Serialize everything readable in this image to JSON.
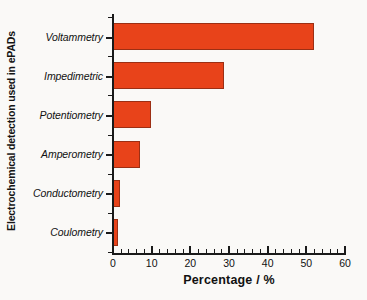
{
  "chart_data": {
    "type": "bar",
    "orientation": "horizontal",
    "title": "",
    "xlabel": "Percentage / %",
    "ylabel": "Electrochemical detection used in ePADs",
    "categories": [
      "Voltammetry",
      "Impedimetric",
      "Potentiometry",
      "Amperometry",
      "Conductometry",
      "Coulometry"
    ],
    "values": [
      52.0,
      28.7,
      9.8,
      6.9,
      1.7,
      1.2
    ],
    "xlim": [
      0,
      60
    ],
    "xticks": [
      0,
      10,
      20,
      30,
      40,
      50,
      60
    ],
    "xtick_labels": [
      "0",
      "10",
      "20",
      "30",
      "40",
      "50",
      "60"
    ],
    "minor_tick_interval": 2,
    "grid": false,
    "legend": null,
    "bar_color": "#e8431a",
    "bar_edge_color": "#9c2f14",
    "axis_color": "#1a1a1a",
    "background_color": "#faf9f7"
  }
}
